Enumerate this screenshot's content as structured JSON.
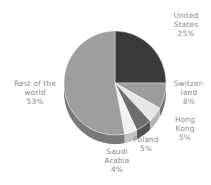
{
  "chart_data": {
    "type": "pie",
    "title": "",
    "subtitle": "",
    "xlabel": "",
    "ylabel": "",
    "legend_position": "none",
    "grid": false,
    "style": "3d-pie-grayscale",
    "background_color": "#ffffff",
    "label_text_color": "#8a8a8a",
    "categories": [
      "United States",
      "Switzerland",
      "Hong Kong",
      "Poland",
      "Saudi Arabia",
      "Rest of the world"
    ],
    "values": [
      25,
      8,
      5,
      5,
      4,
      53
    ],
    "value_unit": "%",
    "slices": [
      {
        "name": "United States",
        "label_lines": "United\nStates\n25%",
        "value": 25,
        "value_label": "25%",
        "color": "#3a3a3a",
        "side_color": "#2b2b2b",
        "start_pct": 0,
        "end_pct": 25
      },
      {
        "name": "Switzerland",
        "label_lines": "Switzer-\nland\n8%",
        "value": 8,
        "value_label": "8%",
        "color": "#9c9c9c",
        "side_color": "#737373",
        "start_pct": 25,
        "end_pct": 33
      },
      {
        "name": "Hong Kong",
        "label_lines": "Hong\nKong\n5%",
        "value": 5,
        "value_label": "5%",
        "color": "#e6e6e6",
        "side_color": "#b4b4b4",
        "start_pct": 33,
        "end_pct": 38
      },
      {
        "name": "Poland",
        "label_lines": "Poland\n5%",
        "value": 5,
        "value_label": "5%",
        "color": "#6e6e6e",
        "side_color": "#535353",
        "start_pct": 38,
        "end_pct": 43
      },
      {
        "name": "Saudi Arabia",
        "label_lines": "Saudi\nArabia\n4%",
        "value": 4,
        "value_label": "4%",
        "color": "#f2f2f2",
        "side_color": "#c2c2c2",
        "start_pct": 43,
        "end_pct": 47
      },
      {
        "name": "Rest of the world",
        "label_lines": "Rest of the\nworld\n53%",
        "value": 53,
        "value_label": "53%",
        "color": "#9e9e9e",
        "side_color": "#787878",
        "start_pct": 47,
        "end_pct": 100
      }
    ],
    "geometry": {
      "center_x": 115,
      "center_y": 83,
      "radius_x": 51,
      "radius_y": 52,
      "depth": 9
    }
  }
}
